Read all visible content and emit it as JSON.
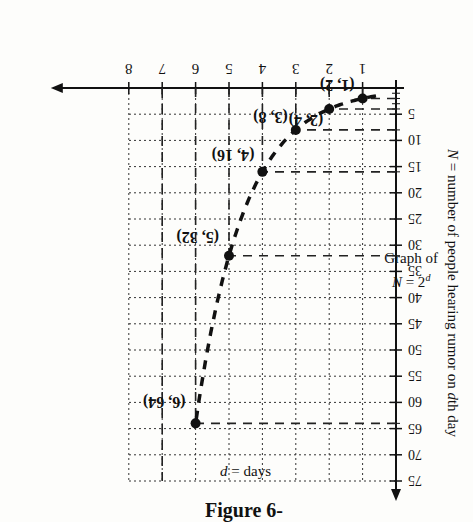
{
  "figure": {
    "title_cropped": "Figure 6-",
    "graph_title_line1": "Graph of",
    "graph_title_line2": "N = 2",
    "graph_title_exp": "d"
  },
  "chart_data": {
    "type": "scatter",
    "xlabel": "d = days",
    "ylabel": "N = number of people hearing rumor on dth day",
    "x_ticks": [
      "1",
      "2",
      "3",
      "4",
      "5",
      "6",
      "7",
      "8"
    ],
    "y_ticks": [
      "5",
      "10",
      "15",
      "20",
      "25",
      "30",
      "35",
      "40",
      "45",
      "50",
      "55",
      "60",
      "65",
      "70",
      "75"
    ],
    "xlim": [
      0,
      8.5
    ],
    "ylim": [
      0,
      77
    ],
    "grid": true,
    "rotation_deg": 180,
    "series": [
      {
        "name": "N = 2^d",
        "x": [
          1,
          2,
          3,
          4,
          5,
          6
        ],
        "y": [
          2,
          4,
          8,
          16,
          32,
          64
        ],
        "style": "dashed curve with points"
      }
    ],
    "point_labels": [
      "(1, 2)",
      "(2, 4)",
      "(3, 8)",
      "(4, 16)",
      "(5, 32)",
      "(6, 64)"
    ],
    "vertical_dashed_asymptote_x": 7
  },
  "axes": {
    "x_label_var": "d",
    "x_label_rest": " = days",
    "y_label_var_N": "N",
    "y_label_mid": " = number of people hearing rumor on ",
    "y_label_var_d": "d",
    "y_label_end": "th day"
  }
}
